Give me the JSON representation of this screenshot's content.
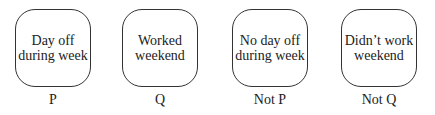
{
  "cards": [
    {
      "line1": "Day off",
      "line2": "during week",
      "label": "P"
    },
    {
      "line1": "Worked",
      "line2": "weekend",
      "label": "Q"
    },
    {
      "line1": "No day off",
      "line2": "during week",
      "label": "Not P"
    },
    {
      "line1": "Didn’t work",
      "line2": "weekend",
      "label": "Not Q"
    }
  ]
}
